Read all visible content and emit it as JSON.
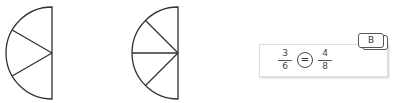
{
  "diagram": {
    "left_shape": {
      "type": "semicircle",
      "sectors": 3
    },
    "right_shape": {
      "type": "semicircle",
      "sectors": 4
    },
    "equation": {
      "left_fraction": {
        "numerator": "3",
        "denominator": "6"
      },
      "operator": "=",
      "right_fraction": {
        "numerator": "4",
        "denominator": "8"
      },
      "label": "B"
    }
  }
}
